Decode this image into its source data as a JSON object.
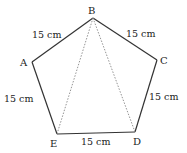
{
  "diagram": {
    "type": "pentagon",
    "vertices": [
      {
        "id": "A",
        "label": "A",
        "x": 32,
        "y": 62
      },
      {
        "id": "B",
        "label": "B",
        "x": 93,
        "y": 18
      },
      {
        "id": "C",
        "label": "C",
        "x": 157,
        "y": 60
      },
      {
        "id": "D",
        "label": "D",
        "x": 135,
        "y": 132
      },
      {
        "id": "E",
        "label": "E",
        "x": 57,
        "y": 134
      }
    ],
    "sides": [
      {
        "from": "A",
        "to": "B",
        "label": "15 cm"
      },
      {
        "from": "B",
        "to": "C",
        "label": "15 cm"
      },
      {
        "from": "C",
        "to": "D",
        "label": "15 cm"
      },
      {
        "from": "D",
        "to": "E",
        "label": "15 cm"
      },
      {
        "from": "E",
        "to": "A",
        "label": "15 cm"
      }
    ],
    "diagonals": [
      {
        "from": "B",
        "to": "E",
        "style": "dotted"
      },
      {
        "from": "B",
        "to": "D",
        "style": "dotted"
      }
    ],
    "labels": {
      "A": "A",
      "B": "B",
      "C": "C",
      "D": "D",
      "E": "E",
      "side_AB": "15 cm",
      "side_BC": "15 cm",
      "side_CD": "15 cm",
      "side_DE": "15 cm",
      "side_EA": "15 cm"
    },
    "colors": {
      "line": "#333333",
      "dotted": "#888888",
      "text": "#222222"
    }
  }
}
